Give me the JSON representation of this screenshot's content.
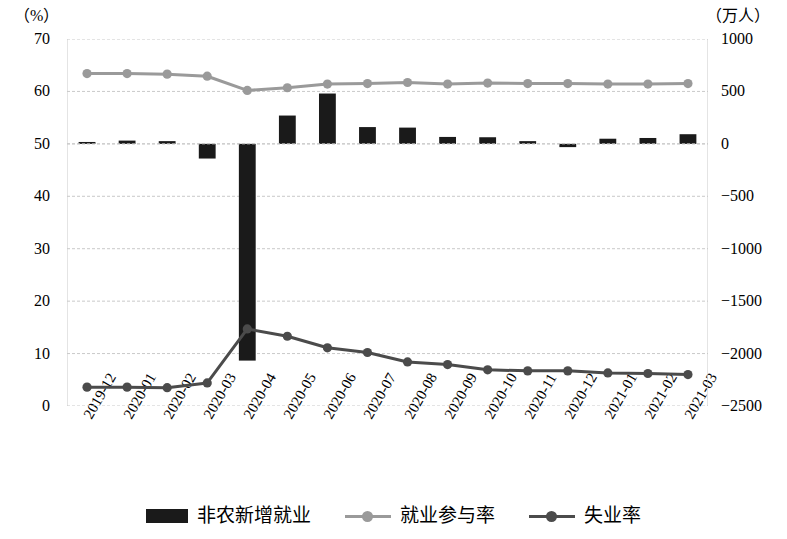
{
  "chart_data": {
    "type": "bar",
    "title": "",
    "subtitle": "",
    "xlabel": "",
    "ylabel": "（%）",
    "y2label": "（万人）",
    "grid": true,
    "legend_position": "bottom",
    "categories": [
      "2019-12",
      "2020-01",
      "2020-02",
      "2020-03",
      "2020-04",
      "2020-05",
      "2020-06",
      "2020-07",
      "2020-08",
      "2020-09",
      "2020-10",
      "2020-11",
      "2020-12",
      "2021-01",
      "2021-02",
      "2021-03"
    ],
    "left_axis": {
      "unit": "（%）",
      "min": 0,
      "max": 70,
      "step": 10,
      "ticks": [
        "70",
        "60",
        "50",
        "40",
        "30",
        "20",
        "10",
        "0"
      ]
    },
    "right_axis": {
      "unit": "（万人）",
      "min": -2500,
      "max": 1000,
      "step": 500,
      "ticks": [
        "1000",
        "500",
        "0",
        "−500",
        "−1000",
        "−1500",
        "−2000",
        "−2500"
      ]
    },
    "series": [
      {
        "name": "非农新增就业",
        "type": "bar",
        "axis": "right",
        "color": "#1a1a1a",
        "values": [
          18,
          31,
          26,
          -140,
          -2067,
          270,
          480,
          160,
          155,
          66,
          63,
          26,
          -31,
          49,
          56,
          92
        ]
      },
      {
        "name": "就业参与率",
        "type": "line",
        "axis": "left",
        "color": "#9a9a9a",
        "values": [
          63.4,
          63.4,
          63.3,
          62.9,
          60.2,
          60.7,
          61.4,
          61.5,
          61.7,
          61.4,
          61.6,
          61.5,
          61.5,
          61.4,
          61.4,
          61.5
        ]
      },
      {
        "name": "失业率",
        "type": "line",
        "axis": "left",
        "color": "#4b4b4b",
        "values": [
          3.6,
          3.6,
          3.5,
          4.4,
          14.7,
          13.3,
          11.1,
          10.2,
          8.4,
          7.9,
          6.9,
          6.7,
          6.7,
          6.3,
          6.2,
          6.0
        ]
      }
    ]
  },
  "legend": {
    "items": [
      {
        "label": "非农新增就业",
        "marker": "bar-swatch",
        "color": "#1a1a1a"
      },
      {
        "label": "就业参与率",
        "marker": "line-marker",
        "color": "#9a9a9a"
      },
      {
        "label": "失业率",
        "marker": "line-marker",
        "color": "#4b4b4b"
      }
    ]
  }
}
